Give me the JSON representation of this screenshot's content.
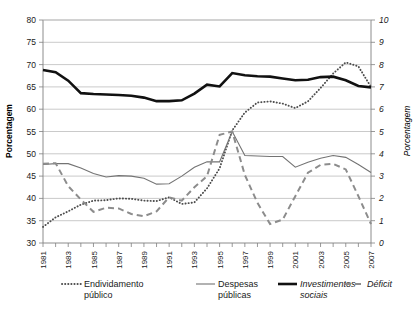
{
  "chart_data": {
    "type": "line",
    "title": "",
    "subtitle": "",
    "xlabel": "",
    "ylabel": "Porcentagem",
    "ylabel_right": "Porcentagem",
    "x": [
      1981,
      1982,
      1983,
      1984,
      1985,
      1986,
      1987,
      1988,
      1989,
      1990,
      1991,
      1992,
      1993,
      1994,
      1995,
      1996,
      1997,
      1998,
      1999,
      2000,
      2001,
      2002,
      2003,
      2004,
      2005,
      2006,
      2007
    ],
    "xtick_labels": [
      "1981",
      "1983",
      "1985",
      "1987",
      "1989",
      "1991",
      "1993",
      "1995",
      "1997",
      "1999",
      "2001",
      "2003",
      "2005",
      "2007"
    ],
    "xlim": [
      1981,
      2007
    ],
    "ylim": [
      30,
      80
    ],
    "ylim_right": [
      0,
      10
    ],
    "ytick_labels": [
      "30",
      "35",
      "40",
      "45",
      "50",
      "55",
      "60",
      "65",
      "70",
      "75",
      "80"
    ],
    "ytick_labels_right": [
      "0",
      "1",
      "2",
      "3",
      "4",
      "5",
      "6",
      "7",
      "8",
      "9",
      "10"
    ],
    "grid": true,
    "legend_position": "bottom",
    "series": [
      {
        "name": "Endividamento público",
        "style": "dotted",
        "axis": "right",
        "color": "#4d4d4d",
        "values": [
          0.72,
          1.15,
          1.42,
          1.72,
          1.9,
          1.92,
          2.0,
          1.98,
          1.9,
          1.88,
          2.05,
          1.75,
          1.82,
          2.45,
          3.35,
          5.05,
          5.85,
          6.3,
          6.35,
          6.25,
          6.05,
          6.35,
          6.95,
          7.6,
          8.1,
          7.92,
          7.0
        ]
      },
      {
        "name": "Despesas públicas",
        "style": "thin-solid",
        "axis": "left",
        "color": "#737373",
        "values": [
          47.6,
          47.8,
          47.8,
          46.8,
          45.6,
          44.8,
          45.1,
          45.0,
          44.5,
          43.2,
          43.3,
          45.0,
          47.0,
          48.2,
          48.2,
          55.0,
          49.6,
          49.5,
          49.4,
          49.4,
          47.0,
          48.1,
          49.0,
          49.6,
          49.2,
          47.6,
          45.8
        ]
      },
      {
        "name": "Investimentos sociais",
        "style": "thick-solid",
        "axis": "left",
        "color": "#111111",
        "values": [
          68.8,
          68.3,
          66.4,
          63.6,
          63.4,
          63.3,
          63.2,
          63.0,
          62.6,
          61.8,
          61.8,
          62.0,
          63.5,
          65.5,
          65.1,
          68.1,
          67.6,
          67.4,
          67.3,
          66.9,
          66.5,
          66.6,
          67.2,
          67.3,
          66.5,
          65.2,
          64.9
        ]
      },
      {
        "name": "Déficit",
        "style": "dashed",
        "axis": "right",
        "color": "#8c8c8c",
        "values": [
          3.55,
          3.58,
          2.55,
          1.95,
          1.4,
          1.58,
          1.55,
          1.3,
          1.2,
          1.42,
          2.05,
          1.9,
          2.5,
          3.0,
          4.85,
          5.0,
          3.05,
          1.8,
          0.85,
          1.05,
          2.1,
          3.15,
          3.5,
          3.55,
          3.3,
          2.1,
          0.85
        ]
      }
    ]
  },
  "axes": {
    "left_title": "Porcentagem",
    "right_title": "Porcentagem"
  },
  "legend": {
    "items": [
      {
        "label_line1": "Endividamento",
        "label_line2": "público",
        "style": "dotted",
        "italic": false
      },
      {
        "label_line1": "Despesas",
        "label_line2": "públicas",
        "style": "thin-solid",
        "italic": false
      },
      {
        "label_line1": "Investimentos",
        "label_line2": "sociais",
        "style": "thick-solid",
        "italic": true
      },
      {
        "label_line1": "Déficit",
        "label_line2": "",
        "style": "dashed",
        "italic": true
      }
    ]
  }
}
